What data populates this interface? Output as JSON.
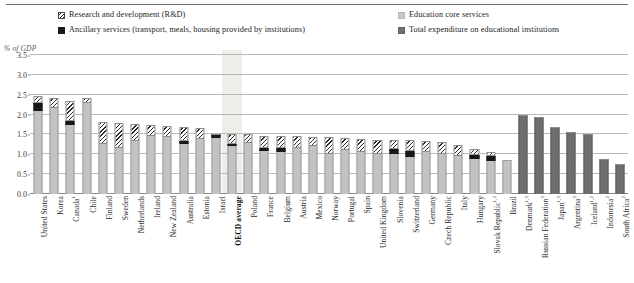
{
  "figure": {
    "unit_label": "% of GDP"
  },
  "legend": {
    "items": [
      {
        "key": "rd",
        "label": "Research and development (R&D)",
        "swatch": "hatch-diagonal",
        "color": "#ffffff"
      },
      {
        "key": "anc",
        "label": "Ancillary services (transport, meals, housing provided by institutions)",
        "swatch": "solid-black",
        "color": "#171717"
      },
      {
        "key": "core",
        "label": "Education core services",
        "swatch": "solid-light-gray",
        "color": "#c2c2c2"
      },
      {
        "key": "total",
        "label": "Total expenditure on educational institutions",
        "swatch": "solid-dark-gray",
        "color": "#6e6e6e"
      }
    ]
  },
  "chart_data": {
    "type": "bar",
    "subtype": "stacked-vertical",
    "title": "",
    "xlabel": "",
    "ylabel": "% of GDP",
    "ylim": [
      0.0,
      3.5
    ],
    "yticks": [
      "0.0",
      "0.5",
      "1.0",
      "1.5",
      "2.0",
      "2.5",
      "3.0",
      "3.5"
    ],
    "ytick_values": [
      0.0,
      0.5,
      1.0,
      1.5,
      2.0,
      2.5,
      3.0,
      3.5
    ],
    "grid": "horizontal",
    "legend_position": "top",
    "highlight_category": "OECD average",
    "series": [
      {
        "name": "Education core services",
        "key": "core",
        "color": "#c2c2c2"
      },
      {
        "name": "Ancillary services (transport, meals, housing provided by institutions)",
        "key": "anc",
        "color": "#171717"
      },
      {
        "name": "Research and development (R&D)",
        "key": "rd",
        "color": "#ffffff"
      },
      {
        "name": "Total expenditure on educational institutions",
        "key": "total",
        "color": "#6e6e6e"
      }
    ],
    "categories": [
      "United States",
      "Korea",
      "Canada",
      "Chile",
      "Finland",
      "Sweden",
      "Netherlands",
      "Ireland",
      "New Zealand",
      "Australia",
      "Estonia",
      "Israel",
      "OECD average",
      "Poland",
      "France",
      "Belgium",
      "Austria",
      "Mexico",
      "Norway",
      "Portugal",
      "Spain",
      "United Kingdom",
      "Slovenia",
      "Switzerland",
      "Germany",
      "Czech Republic",
      "Italy",
      "Hungary",
      "Slovak Republic",
      "Brazil",
      "Denmark",
      "Russian Federation",
      "Japan",
      "Argentina",
      "Iceland",
      "Indonesia",
      "South Africa"
    ],
    "category_footnotes": [
      "",
      "",
      "1",
      "",
      "",
      "",
      "",
      "",
      "",
      "",
      "",
      "",
      "",
      "",
      "",
      "",
      "",
      "",
      "",
      "",
      "",
      "",
      "",
      "",
      "",
      "",
      "",
      "",
      "1,2",
      "",
      "1,2",
      "2",
      "1,2",
      "2",
      "1,2",
      "2",
      "2"
    ],
    "points": [
      {
        "category": "United States",
        "core": 2.1,
        "anc": 0.2,
        "rd": 0.18,
        "total": null
      },
      {
        "category": "Korea",
        "core": 2.17,
        "anc": 0.0,
        "rd": 0.25,
        "total": null
      },
      {
        "category": "Canada",
        "core": 1.73,
        "anc": 0.1,
        "rd": 0.52,
        "total": null
      },
      {
        "category": "Chile",
        "core": 2.3,
        "anc": 0.0,
        "rd": 0.13,
        "total": null
      },
      {
        "category": "Finland",
        "core": 1.27,
        "anc": 0.0,
        "rd": 0.54,
        "total": null
      },
      {
        "category": "Sweden",
        "core": 1.17,
        "anc": 0.0,
        "rd": 0.62,
        "total": null
      },
      {
        "category": "Netherlands",
        "core": 1.34,
        "anc": 0.0,
        "rd": 0.42,
        "total": null
      },
      {
        "category": "Ireland",
        "core": 1.45,
        "anc": 0.0,
        "rd": 0.29,
        "total": null
      },
      {
        "category": "New Zealand",
        "core": 1.43,
        "anc": 0.0,
        "rd": 0.28,
        "total": null
      },
      {
        "category": "Australia",
        "core": 1.25,
        "anc": 0.08,
        "rd": 0.35,
        "total": null
      },
      {
        "category": "Estonia",
        "core": 1.38,
        "anc": 0.0,
        "rd": 0.27,
        "total": null
      },
      {
        "category": "Israel",
        "core": 1.4,
        "anc": 0.12,
        "rd": 0.0,
        "total": null
      },
      {
        "category": "OECD average",
        "core": 1.2,
        "anc": 0.07,
        "rd": 0.25,
        "total": null
      },
      {
        "category": "Poland",
        "core": 1.29,
        "anc": 0.0,
        "rd": 0.22,
        "total": null
      },
      {
        "category": "France",
        "core": 1.08,
        "anc": 0.09,
        "rd": 0.3,
        "total": null
      },
      {
        "category": "Belgium",
        "core": 1.06,
        "anc": 0.09,
        "rd": 0.3,
        "total": null
      },
      {
        "category": "Austria",
        "core": 1.17,
        "anc": 0.0,
        "rd": 0.28,
        "total": null
      },
      {
        "category": "Mexico",
        "core": 1.22,
        "anc": 0.0,
        "rd": 0.21,
        "total": null
      },
      {
        "category": "Norway",
        "core": 1.02,
        "anc": 0.0,
        "rd": 0.41,
        "total": null
      },
      {
        "category": "Portugal",
        "core": 1.1,
        "anc": 0.0,
        "rd": 0.3,
        "total": null
      },
      {
        "category": "Spain",
        "core": 1.05,
        "anc": 0.0,
        "rd": 0.33,
        "total": null
      },
      {
        "category": "United Kingdom",
        "core": 1.0,
        "anc": 0.0,
        "rd": 0.37,
        "total": null
      },
      {
        "category": "Slovenia",
        "core": 1.0,
        "anc": 0.13,
        "rd": 0.23,
        "total": null
      },
      {
        "category": "Switzerland",
        "core": 0.94,
        "anc": 0.15,
        "rd": 0.26,
        "total": null
      },
      {
        "category": "Germany",
        "core": 1.07,
        "anc": 0.0,
        "rd": 0.26,
        "total": null
      },
      {
        "category": "Czech Republic",
        "core": 1.0,
        "anc": 0.0,
        "rd": 0.31,
        "total": null
      },
      {
        "category": "Italy",
        "core": 0.96,
        "anc": 0.0,
        "rd": 0.28,
        "total": null
      },
      {
        "category": "Hungary",
        "core": 0.89,
        "anc": 0.08,
        "rd": 0.17,
        "total": null
      },
      {
        "category": "Slovak Republic",
        "core": 0.83,
        "anc": 0.12,
        "rd": 0.1,
        "total": null
      },
      {
        "category": "Brazil",
        "core": 0.86,
        "anc": 0.0,
        "rd": 0.0,
        "total": null
      },
      {
        "category": "Denmark",
        "core": null,
        "anc": null,
        "rd": null,
        "total": 2.0
      },
      {
        "category": "Russian Federation",
        "core": null,
        "anc": null,
        "rd": null,
        "total": 1.93
      },
      {
        "category": "Japan",
        "core": null,
        "anc": null,
        "rd": null,
        "total": 1.7
      },
      {
        "category": "Argentina",
        "core": null,
        "anc": null,
        "rd": null,
        "total": 1.56
      },
      {
        "category": "Iceland",
        "core": null,
        "anc": null,
        "rd": null,
        "total": 1.5
      },
      {
        "category": "Indonesia",
        "core": null,
        "anc": null,
        "rd": null,
        "total": 0.87
      },
      {
        "category": "South Africa",
        "core": null,
        "anc": null,
        "rd": null,
        "total": 0.76
      }
    ]
  }
}
